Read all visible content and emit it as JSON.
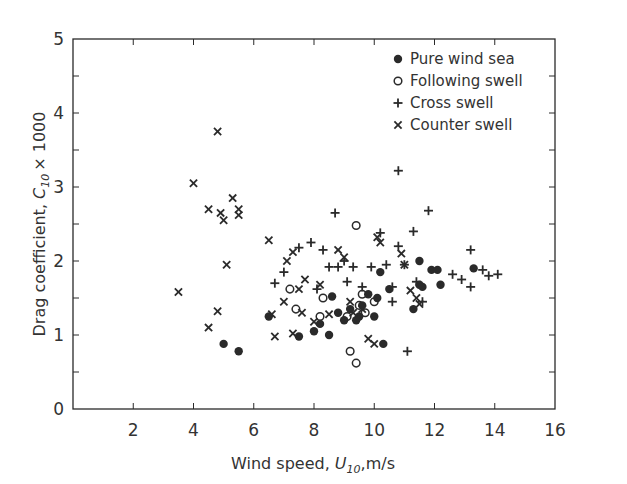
{
  "chart_data": {
    "type": "scatter",
    "title": "",
    "xlabel": "Wind speed, U10, m/s",
    "ylabel": "Drag coefficient, C10 × 1000",
    "xlim": [
      0,
      16
    ],
    "ylim": [
      0,
      5
    ],
    "x_ticks": [
      2,
      4,
      6,
      8,
      10,
      12,
      14,
      16
    ],
    "y_ticks": [
      0,
      1,
      2,
      3,
      4,
      5
    ],
    "grid": false,
    "legend_position": "upper right",
    "series": [
      {
        "name": "Pure wind sea",
        "marker": "filled-circle",
        "points": [
          [
            5.0,
            0.88
          ],
          [
            5.5,
            0.78
          ],
          [
            6.5,
            1.25
          ],
          [
            7.5,
            0.98
          ],
          [
            8.0,
            1.05
          ],
          [
            8.2,
            1.15
          ],
          [
            8.5,
            1.0
          ],
          [
            8.8,
            1.3
          ],
          [
            9.0,
            1.2
          ],
          [
            9.2,
            1.35
          ],
          [
            9.5,
            1.25
          ],
          [
            9.6,
            1.4
          ],
          [
            9.8,
            1.55
          ],
          [
            10.0,
            1.25
          ],
          [
            10.1,
            1.5
          ],
          [
            10.2,
            1.85
          ],
          [
            10.3,
            0.88
          ],
          [
            10.5,
            1.62
          ],
          [
            11.3,
            1.35
          ],
          [
            11.5,
            1.68
          ],
          [
            11.6,
            1.65
          ],
          [
            11.5,
            2.0
          ],
          [
            11.9,
            1.88
          ],
          [
            12.1,
            1.88
          ],
          [
            12.2,
            1.68
          ],
          [
            13.3,
            1.9
          ],
          [
            8.6,
            1.52
          ],
          [
            9.4,
            1.2
          ]
        ]
      },
      {
        "name": "Following swell",
        "marker": "open-circle",
        "points": [
          [
            7.2,
            1.62
          ],
          [
            7.4,
            1.35
          ],
          [
            8.2,
            1.25
          ],
          [
            8.3,
            1.5
          ],
          [
            9.1,
            1.25
          ],
          [
            9.2,
            0.78
          ],
          [
            9.4,
            0.62
          ],
          [
            9.4,
            2.48
          ],
          [
            9.5,
            1.4
          ],
          [
            9.7,
            1.3
          ],
          [
            9.6,
            1.55
          ],
          [
            10.0,
            1.45
          ]
        ]
      },
      {
        "name": "Cross swell",
        "marker": "plus",
        "points": [
          [
            6.7,
            1.7
          ],
          [
            7.0,
            1.85
          ],
          [
            7.5,
            2.18
          ],
          [
            7.9,
            2.25
          ],
          [
            8.3,
            2.15
          ],
          [
            8.5,
            1.92
          ],
          [
            8.7,
            2.65
          ],
          [
            8.8,
            1.92
          ],
          [
            9.0,
            2.0
          ],
          [
            9.3,
            1.92
          ],
          [
            9.6,
            1.65
          ],
          [
            9.9,
            1.92
          ],
          [
            10.2,
            2.38
          ],
          [
            10.4,
            1.95
          ],
          [
            10.6,
            1.65
          ],
          [
            10.8,
            2.2
          ],
          [
            10.8,
            3.22
          ],
          [
            11.0,
            1.95
          ],
          [
            11.1,
            0.78
          ],
          [
            11.3,
            2.4
          ],
          [
            11.4,
            1.72
          ],
          [
            11.6,
            1.45
          ],
          [
            11.8,
            2.68
          ],
          [
            12.6,
            1.82
          ],
          [
            12.9,
            1.75
          ],
          [
            13.2,
            1.65
          ],
          [
            13.2,
            2.15
          ],
          [
            13.6,
            1.88
          ],
          [
            13.8,
            1.8
          ],
          [
            14.1,
            1.82
          ],
          [
            8.1,
            1.62
          ],
          [
            9.1,
            1.72
          ],
          [
            10.6,
            1.45
          ]
        ]
      },
      {
        "name": "Counter swell",
        "marker": "x",
        "points": [
          [
            3.5,
            1.58
          ],
          [
            4.0,
            3.05
          ],
          [
            4.5,
            2.7
          ],
          [
            4.5,
            1.1
          ],
          [
            4.8,
            3.75
          ],
          [
            4.8,
            1.32
          ],
          [
            4.9,
            2.65
          ],
          [
            5.0,
            2.55
          ],
          [
            5.1,
            1.95
          ],
          [
            5.3,
            2.85
          ],
          [
            5.5,
            2.7
          ],
          [
            5.5,
            2.62
          ],
          [
            6.5,
            2.28
          ],
          [
            6.6,
            1.28
          ],
          [
            6.7,
            0.98
          ],
          [
            7.0,
            1.45
          ],
          [
            7.1,
            2.0
          ],
          [
            7.3,
            1.02
          ],
          [
            7.5,
            1.62
          ],
          [
            7.6,
            1.3
          ],
          [
            7.7,
            1.75
          ],
          [
            8.0,
            1.18
          ],
          [
            8.2,
            1.68
          ],
          [
            8.5,
            1.28
          ],
          [
            8.8,
            2.15
          ],
          [
            9.0,
            2.05
          ],
          [
            9.2,
            1.45
          ],
          [
            9.6,
            1.35
          ],
          [
            9.8,
            0.95
          ],
          [
            10.0,
            0.88
          ],
          [
            10.1,
            2.32
          ],
          [
            10.2,
            2.25
          ],
          [
            11.0,
            1.95
          ],
          [
            11.2,
            1.6
          ],
          [
            11.4,
            1.5
          ],
          [
            11.5,
            1.42
          ],
          [
            7.3,
            2.12
          ],
          [
            9.3,
            1.3
          ],
          [
            10.9,
            2.1
          ]
        ]
      }
    ]
  },
  "legend": {
    "items": [
      {
        "label": "Pure wind sea",
        "marker": "filled-circle"
      },
      {
        "label": "Following swell",
        "marker": "open-circle"
      },
      {
        "label": "Cross swell",
        "marker": "plus"
      },
      {
        "label": "Counter swell",
        "marker": "x"
      }
    ]
  },
  "axes": {
    "x_title_main": "Wind speed,",
    "x_title_sym": "U",
    "x_title_sub": "10",
    "x_title_unit": ",m/s",
    "y_title_main": "Drag coefficient,",
    "y_title_sym": "C",
    "y_title_sub": "10",
    "y_title_unit": "× 1000",
    "origin_label": "0"
  },
  "colors": {
    "ink": "#2a2a2a",
    "background": "#ffffff"
  }
}
